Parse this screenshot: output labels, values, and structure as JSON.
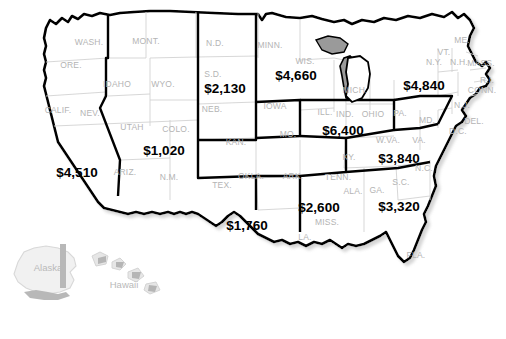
{
  "map": {
    "title": "United States regional map with dollar values",
    "background_color": "#ffffff",
    "state_border_color": "#d0d0d0",
    "region_border_color": "#000000",
    "state_label_color": "#b4b4b4",
    "value_label_color": "#000000",
    "inset_fill_color": "#e9e9e9"
  },
  "chart_data": {
    "type": "map",
    "value_prefix": "$",
    "regions": [
      {
        "name": "Pacific",
        "value": 4510,
        "label": "$4,510",
        "x": 77,
        "y": 172
      },
      {
        "name": "Mountain",
        "value": 1020,
        "label": "$1,020",
        "x": 164,
        "y": 150
      },
      {
        "name": "West North Central",
        "value": 2130,
        "label": "$2,130",
        "x": 225,
        "y": 88
      },
      {
        "name": "East North Central",
        "value": 4660,
        "label": "$4,660",
        "x": 296,
        "y": 75
      },
      {
        "name": "Great Lakes",
        "value": 6400,
        "label": "$6,400",
        "x": 343,
        "y": 130
      },
      {
        "name": "Middle Atlantic",
        "value": 4840,
        "label": "$4,840",
        "x": 424,
        "y": 85
      },
      {
        "name": "South Atlantic Upper",
        "value": 3840,
        "label": "$3,840",
        "x": 399,
        "y": 158
      },
      {
        "name": "South Atlantic Lower",
        "value": 3320,
        "label": "$3,320",
        "x": 399,
        "y": 206
      },
      {
        "name": "East South Central",
        "value": 2600,
        "label": "$2,600",
        "x": 319,
        "y": 207
      },
      {
        "name": "West South Central",
        "value": 1760,
        "label": "$1,760",
        "x": 247,
        "y": 225
      }
    ],
    "states": [
      {
        "abbr": "WASH.",
        "x": 89,
        "y": 42
      },
      {
        "abbr": "ORE.",
        "x": 71,
        "y": 65
      },
      {
        "abbr": "MONT.",
        "x": 146,
        "y": 41
      },
      {
        "abbr": "IDAHO",
        "x": 117,
        "y": 84
      },
      {
        "abbr": "WYO.",
        "x": 163,
        "y": 84
      },
      {
        "abbr": "N.D.",
        "x": 215,
        "y": 43
      },
      {
        "abbr": "S.D.",
        "x": 213,
        "y": 74
      },
      {
        "abbr": "NEB.",
        "x": 212,
        "y": 109
      },
      {
        "abbr": "MINN.",
        "x": 270,
        "y": 45
      },
      {
        "abbr": "WIS.",
        "x": 305,
        "y": 61
      },
      {
        "abbr": "IOWA",
        "x": 275,
        "y": 106
      },
      {
        "abbr": "CALIF.",
        "x": 58,
        "y": 110
      },
      {
        "abbr": "NEV.",
        "x": 90,
        "y": 113
      },
      {
        "abbr": "UTAH",
        "x": 132,
        "y": 127
      },
      {
        "abbr": "COLO.",
        "x": 176,
        "y": 129
      },
      {
        "abbr": "KAN.",
        "x": 236,
        "y": 142
      },
      {
        "abbr": "MO.",
        "x": 288,
        "y": 134
      },
      {
        "abbr": "ARIZ.",
        "x": 125,
        "y": 172
      },
      {
        "abbr": "N.M.",
        "x": 169,
        "y": 177
      },
      {
        "abbr": "OKLA.",
        "x": 251,
        "y": 176
      },
      {
        "abbr": "TEX.",
        "x": 222,
        "y": 185
      },
      {
        "abbr": "ARK.",
        "x": 293,
        "y": 176
      },
      {
        "abbr": "LA.",
        "x": 305,
        "y": 237
      },
      {
        "abbr": "MISS.",
        "x": 327,
        "y": 222
      },
      {
        "abbr": "ALA.",
        "x": 353,
        "y": 191
      },
      {
        "abbr": "TENN.",
        "x": 338,
        "y": 177
      },
      {
        "abbr": "KY.",
        "x": 349,
        "y": 157
      },
      {
        "abbr": "ILL.",
        "x": 325,
        "y": 112
      },
      {
        "abbr": "IND.",
        "x": 345,
        "y": 114
      },
      {
        "abbr": "MICH.",
        "x": 355,
        "y": 90
      },
      {
        "abbr": "OHIO",
        "x": 373,
        "y": 114
      },
      {
        "abbr": "PA.",
        "x": 400,
        "y": 113
      },
      {
        "abbr": "W.VA.",
        "x": 388,
        "y": 140
      },
      {
        "abbr": "VA.",
        "x": 419,
        "y": 140
      },
      {
        "abbr": "N.C.",
        "x": 424,
        "y": 168
      },
      {
        "abbr": "S.C.",
        "x": 401,
        "y": 182
      },
      {
        "abbr": "GA.",
        "x": 377,
        "y": 190
      },
      {
        "abbr": "FLA.",
        "x": 416,
        "y": 255
      },
      {
        "abbr": "ME.",
        "x": 462,
        "y": 40
      },
      {
        "abbr": "VT.",
        "x": 444,
        "y": 52
      },
      {
        "abbr": "N.H.",
        "x": 459,
        "y": 62
      },
      {
        "abbr": "MASS.",
        "x": 481,
        "y": 63
      },
      {
        "abbr": "N.Y.",
        "x": 434,
        "y": 62
      },
      {
        "abbr": "R.I.",
        "x": 487,
        "y": 80
      },
      {
        "abbr": "CONN.",
        "x": 482,
        "y": 90
      },
      {
        "abbr": "N.J.",
        "x": 462,
        "y": 105
      },
      {
        "abbr": "DEL.",
        "x": 474,
        "y": 121
      },
      {
        "abbr": "MD.",
        "x": 427,
        "y": 120
      },
      {
        "abbr": "D.C.",
        "x": 458,
        "y": 131
      }
    ],
    "insets": [
      {
        "name": "Alaska",
        "label": "Alaska",
        "x": 48,
        "y": 267
      },
      {
        "name": "Hawaii",
        "label": "Hawaii",
        "x": 124,
        "y": 284
      }
    ]
  }
}
